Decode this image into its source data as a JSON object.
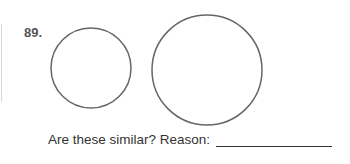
{
  "problem": {
    "number": "89.",
    "question": "Are these similar? Reason:",
    "answer_value": ""
  },
  "figures": {
    "small_circle": {
      "cx": 91,
      "cy": 68,
      "r": 40
    },
    "large_circle": {
      "cx": 207,
      "cy": 70,
      "r": 55
    },
    "stroke_color": "#666666"
  }
}
